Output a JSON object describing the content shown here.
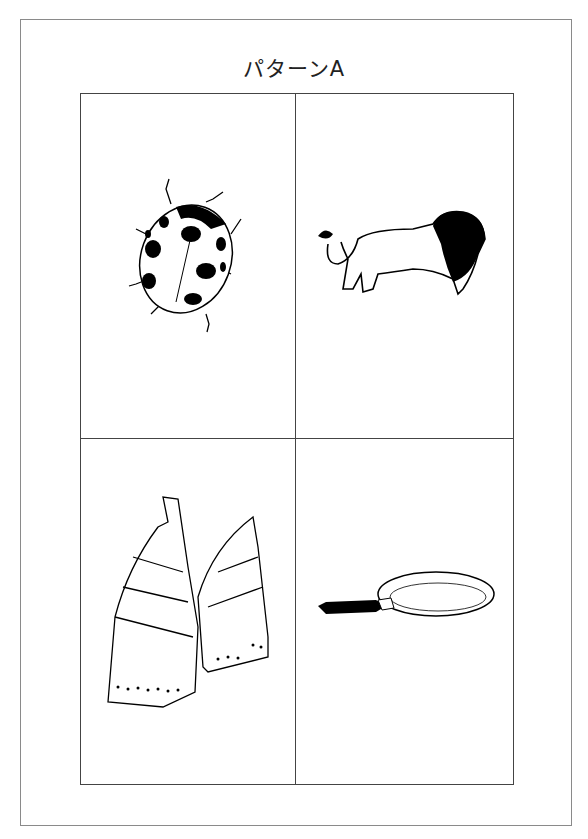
{
  "title": "パターンA",
  "cells": [
    {
      "name": "ladybug",
      "alt": "てんとう虫"
    },
    {
      "name": "lion",
      "alt": "ライオン"
    },
    {
      "name": "bamboo-shoot",
      "alt": "たけのこ"
    },
    {
      "name": "frying-pan",
      "alt": "フライパン"
    }
  ]
}
